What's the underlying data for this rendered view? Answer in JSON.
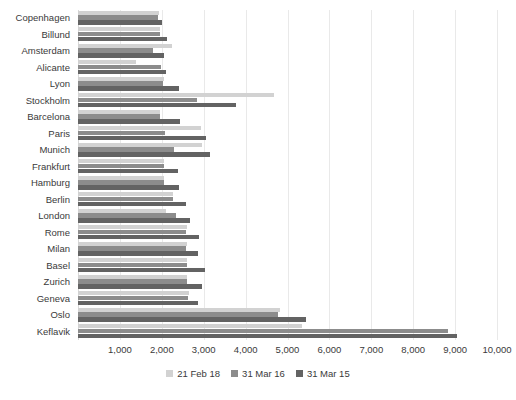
{
  "chart_data": {
    "type": "bar",
    "orientation": "horizontal",
    "title": "",
    "subtitle": "",
    "xlabel": "",
    "ylabel": "",
    "xlim": [
      0,
      10000
    ],
    "ylim": null,
    "grid": true,
    "grid_axis": "x",
    "legend_position": "bottom-center",
    "xticks": [
      1000,
      2000,
      3000,
      4000,
      5000,
      6000,
      7000,
      8000,
      9000,
      10000
    ],
    "xtick_labels": [
      "1,000",
      "2,000",
      "3,000",
      "4,000",
      "5,000",
      "6,000",
      "7,000",
      "8,000",
      "9,000",
      "10,000"
    ],
    "categories": [
      "Copenhagen",
      "Billund",
      "Amsterdam",
      "Alicante",
      "Lyon",
      "Stockholm",
      "Barcelona",
      "Paris",
      "Munich",
      "Frankfurt",
      "Hamburg",
      "Berlin",
      "London",
      "Rome",
      "Milan",
      "Basel",
      "Zurich",
      "Geneva",
      "Oslo",
      "Keflavik"
    ],
    "series": [
      {
        "name": "21 Feb 18",
        "color": "#d2d2d2",
        "values": [
          1930,
          1960,
          2240,
          1380,
          2050,
          4680,
          1950,
          2930,
          2970,
          2050,
          2060,
          2270,
          2110,
          2600,
          2590,
          2600,
          2610,
          2640,
          4810,
          5350
        ]
      },
      {
        "name": "31 Mar 16",
        "color": "#8c8c8c",
        "values": [
          1900,
          1960,
          1780,
          1970,
          2040,
          2830,
          1950,
          2080,
          2280,
          2050,
          2050,
          2260,
          2350,
          2580,
          2580,
          2600,
          2610,
          2630,
          4770,
          8830
        ]
      },
      {
        "name": "31 Mar 15",
        "color": "#636363",
        "values": [
          2010,
          2120,
          2050,
          2110,
          2400,
          3770,
          2430,
          3060,
          3140,
          2390,
          2410,
          2570,
          2670,
          2880,
          2870,
          3030,
          2970,
          2860,
          5450,
          9050
        ]
      }
    ]
  },
  "legend": {
    "items": [
      {
        "label": "21 Feb 18",
        "color": "#d2d2d2",
        "marker": "legend-swatch-icon"
      },
      {
        "label": "31 Mar 16",
        "color": "#8c8c8c",
        "marker": "legend-swatch-icon"
      },
      {
        "label": "31 Mar 15",
        "color": "#636363",
        "marker": "legend-swatch-icon"
      }
    ]
  }
}
